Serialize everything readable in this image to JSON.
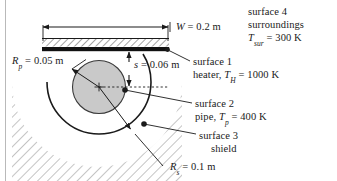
{
  "figure": {
    "type": "thermal-radiation-schematic",
    "colors": {
      "heater_bar": "#111111",
      "pipe_fill": "#c9c9c9",
      "line": "#1a1a1a",
      "hatch": "#555555",
      "background": "#ffffff"
    }
  },
  "labels": {
    "width_dim": {
      "symbol": "W",
      "equals": "=",
      "value": "0.2 m",
      "full": "W = 0.2 m"
    },
    "spacing_dim": {
      "symbol": "s",
      "equals": "=",
      "value": "0.06 m",
      "full": "s = 0.06 m"
    },
    "pipe_radius": {
      "symbol": "R",
      "subscript": "p",
      "equals": "=",
      "value": "0.05 m",
      "full": "Rp = 0.05 m"
    },
    "shield_radius": {
      "symbol": "R",
      "subscript": "s",
      "equals": "=",
      "value": "0.1 m",
      "full": "Rs = 0.1 m"
    },
    "surface1": {
      "title": "surface 1",
      "name": "heater,",
      "symbol": "T",
      "subscript": "H",
      "equals": "=",
      "value": "1000 K",
      "full": "surface 1 heater, TH = 1000 K"
    },
    "surface2": {
      "title": "surface 2",
      "name": "pipe,",
      "symbol": "T",
      "subscript": "p",
      "equals": "=",
      "value": "400 K",
      "full": "surface 2 pipe, Tp = 400 K"
    },
    "surface3": {
      "title": "surface 3",
      "name": "shield",
      "full": "surface 3 shield"
    },
    "surface4": {
      "title": "surface 4",
      "name": "surroundings",
      "symbol": "T",
      "subscript": "sur",
      "equals": "=",
      "value": "300 K",
      "full": "surface 4 surroundings Tsur = 300 K"
    }
  }
}
